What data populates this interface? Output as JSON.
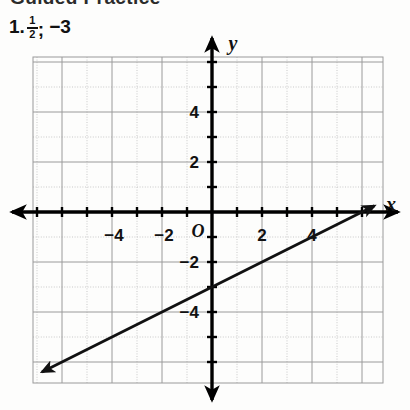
{
  "page": {
    "section_heading": "Guided Practice",
    "background_color": "#fdfdfc"
  },
  "problem": {
    "number": "1.",
    "slope_numerator": "1",
    "slope_denominator": "2",
    "separator": ";",
    "intercept": "−3"
  },
  "graph": {
    "axis_labels": {
      "x": "x",
      "y": "y"
    },
    "origin_label": "O",
    "x_tick_labels": [
      {
        "value": -4,
        "text": "−4"
      },
      {
        "value": -2,
        "text": "−2"
      },
      {
        "value": 2,
        "text": "2"
      },
      {
        "value": 4,
        "text": "4"
      }
    ],
    "y_tick_labels": [
      {
        "value": 4,
        "text": "4"
      },
      {
        "value": 2,
        "text": "2"
      },
      {
        "value": -2,
        "text": "−2"
      },
      {
        "value": -4,
        "text": "−4"
      }
    ],
    "colors": {
      "axis": "#000000",
      "line": "#111111",
      "grid_major": "#9a9a9a",
      "grid_minor": "#c9c9c9"
    }
  },
  "chart_data": {
    "type": "line",
    "title": "",
    "xlabel": "x",
    "ylabel": "y",
    "xlim": [
      -7.2,
      6.8
    ],
    "ylim": [
      -6.8,
      6.2
    ],
    "grid": true,
    "grid_major_step": 2,
    "grid_minor_step": 1,
    "legend": "none",
    "series": [
      {
        "name": "y = 1/2 x - 3",
        "slope": 0.5,
        "intercept": -3,
        "arrows": "both",
        "x": [
          -6.8,
          6.5
        ],
        "y": [
          -6.4,
          0.25
        ]
      }
    ],
    "xticks": [
      -4,
      -2,
      2,
      4
    ],
    "yticks": [
      -4,
      -2,
      2,
      4
    ],
    "annotations": [
      {
        "text": "O",
        "x": 0,
        "y": 0,
        "role": "origin-label"
      }
    ]
  }
}
